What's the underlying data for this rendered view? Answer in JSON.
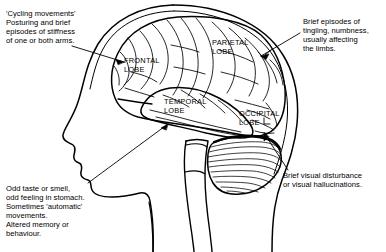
{
  "diagram": {
    "line_color": "#000000",
    "background_color": "#ffffff"
  },
  "annotations": {
    "motor": "'Cycling movements'\nPosturing and brief\nepisodes of stiffness\nof one or both arms.",
    "sensory": "Brief episodes of\ntingling, numbness,\nusually affecting\nthe limbs.",
    "temporal": "Odd taste or smell,\nodd feeling in stomach.\nSometimes 'automatic'\nmovements.\nAltered memory or\nbehaviour.",
    "visual": "Brief visual disturbance\nor visual hallucinations."
  },
  "lobes": {
    "frontal": "FRONTAL\nLOBE",
    "parietal": "PARIETAL\nLOBE",
    "temporal": "TEMPORAL\nLOBE",
    "occipital": "OCCIPITAL\nLOBE"
  }
}
